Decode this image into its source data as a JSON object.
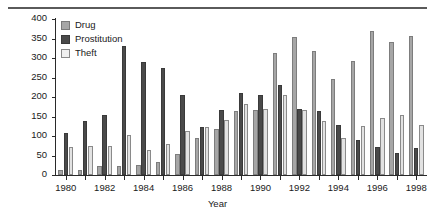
{
  "chart_data": {
    "type": "bar",
    "title": "",
    "xlabel": "Year",
    "ylabel": "Arrests",
    "ylim": [
      0,
      400
    ],
    "yticks": [
      0,
      50,
      100,
      150,
      200,
      250,
      300,
      350,
      400
    ],
    "xticks": [
      1980,
      1982,
      1984,
      1986,
      1988,
      1990,
      1992,
      1994,
      1996,
      1998
    ],
    "grid": false,
    "legend_position": "top-left",
    "categories": [
      "1980",
      "1981",
      "1982",
      "1983",
      "1984",
      "1985",
      "1986",
      "1987",
      "1988",
      "1989",
      "1990",
      "1991",
      "1992",
      "1993",
      "1994",
      "1995",
      "1996",
      "1997",
      "1998"
    ],
    "series": [
      {
        "name": "Drug",
        "color": "#a6a6a6",
        "values": [
          13,
          13,
          23,
          23,
          26,
          34,
          55,
          95,
          119,
          163,
          167,
          312,
          353,
          317,
          247,
          293,
          370,
          340,
          357
        ]
      },
      {
        "name": "Prostitution",
        "color": "#4a4a4a",
        "values": [
          109,
          138,
          155,
          330,
          291,
          274,
          205,
          124,
          166,
          211,
          205,
          231,
          170,
          163,
          127,
          90,
          72,
          56,
          70
        ]
      },
      {
        "name": "Theft",
        "color": "#e2e2e2",
        "values": [
          71,
          74,
          74,
          102,
          63,
          79,
          114,
          124,
          140,
          181,
          168,
          205,
          166,
          139,
          95,
          126,
          145,
          155,
          127
        ]
      }
    ]
  },
  "legend": {
    "items": [
      {
        "label": "Drug"
      },
      {
        "label": "Prostitution"
      },
      {
        "label": "Theft"
      }
    ]
  }
}
